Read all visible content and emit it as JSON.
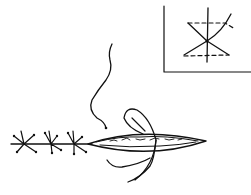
{
  "figure": {
    "title": "",
    "colors": {
      "ink": "#111111",
      "background": "#ffffff"
    },
    "inset": {
      "frame": {
        "x": 164,
        "y": 0,
        "width": 87,
        "height": 72
      },
      "elements": [
        "vertical-axis-line",
        "dashed-top-loop",
        "dashed-bottom-loop",
        "crossing-strands"
      ]
    },
    "closed_sutures": {
      "count": 3
    },
    "open_wound": {
      "label": ""
    },
    "loose_thread": {
      "label": ""
    }
  }
}
